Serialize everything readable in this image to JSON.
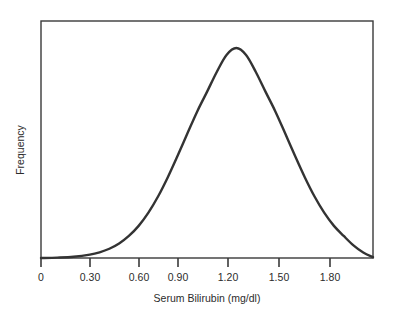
{
  "chart_data": {
    "type": "line",
    "title": "",
    "subtitle": "",
    "xlabel": "Serum Bilirubin (mg/dl)",
    "ylabel": "Frequency",
    "xlim": [
      0.0,
      2.04
    ],
    "ylim": [
      0,
      1.0
    ],
    "grid": false,
    "legend": null,
    "annotations": [],
    "xticks": [
      {
        "value": 0.0,
        "label": "0"
      },
      {
        "value": 0.3,
        "label": "0.30"
      },
      {
        "value": 0.6,
        "label": "0.60"
      },
      {
        "value": 0.9,
        "label": "0.90"
      },
      {
        "value": 1.2,
        "label": "1.20"
      },
      {
        "value": 1.5,
        "label": "1.50"
      },
      {
        "value": 1.8,
        "label": "1.80"
      }
    ],
    "yticks": [],
    "series": [
      {
        "name": "Frequency",
        "color": "#333333",
        "peak_x": 1.2,
        "peak_y": 1.0,
        "x": [
          0.0,
          0.1,
          0.2,
          0.3,
          0.36,
          0.42,
          0.48,
          0.54,
          0.6,
          0.66,
          0.72,
          0.78,
          0.84,
          0.9,
          0.96,
          1.02,
          1.08,
          1.14,
          1.2,
          1.26,
          1.32,
          1.38,
          1.44,
          1.5,
          1.56,
          1.62,
          1.68,
          1.74,
          1.8,
          1.86,
          1.92,
          1.98,
          2.04
        ],
        "y": [
          0.0,
          0.002,
          0.006,
          0.016,
          0.027,
          0.044,
          0.069,
          0.105,
          0.153,
          0.216,
          0.294,
          0.386,
          0.488,
          0.594,
          0.698,
          0.791,
          0.886,
          0.967,
          1.0,
          0.967,
          0.886,
          0.791,
          0.698,
          0.594,
          0.488,
          0.386,
          0.294,
          0.216,
          0.153,
          0.105,
          0.06,
          0.026,
          0.004
        ]
      }
    ]
  },
  "axes": {
    "x_axis_name": "x-axis",
    "y_axis_name": "y-axis",
    "frame_color": "#3a3a3a"
  }
}
